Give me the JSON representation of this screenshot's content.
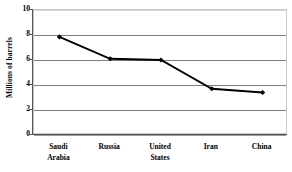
{
  "chart_data": {
    "type": "line",
    "title": "",
    "xlabel": "",
    "ylabel": "Millions of barrels",
    "categories": [
      "Saudi Arabia",
      "Russia",
      "United States",
      "Iran",
      "China"
    ],
    "values": [
      7.85,
      6.1,
      6.0,
      3.7,
      3.4
    ],
    "series": [
      {
        "name": "Oil production",
        "values": [
          7.85,
          6.1,
          6.0,
          3.7,
          3.4
        ]
      }
    ],
    "ylim": [
      0,
      10
    ],
    "yticks": [
      0,
      2,
      4,
      6,
      8,
      10
    ],
    "ytick_labels": [
      "0",
      "2",
      "4",
      "6",
      "8",
      "10"
    ],
    "grid": true,
    "legend": "none",
    "marker": "diamond",
    "line_color": "#000000",
    "marker_color": "#000000",
    "gridline_color": "#7f7f7f",
    "plot_border_color": "#c8c8c8",
    "axis_color": "#555555"
  },
  "axis": {
    "y_title": "Millions of barrels",
    "ticks": [
      {
        "label": "10",
        "value": 10
      },
      {
        "label": "8",
        "value": 8
      },
      {
        "label": "6",
        "value": 6
      },
      {
        "label": "4",
        "value": 4
      },
      {
        "label": "2",
        "value": 2
      },
      {
        "label": "0",
        "value": 0
      }
    ],
    "categories": [
      {
        "line1": "Saudi",
        "line2": "Arabia"
      },
      {
        "line1": "Russia",
        "line2": ""
      },
      {
        "line1": "United",
        "line2": "States"
      },
      {
        "line1": "Iran",
        "line2": ""
      },
      {
        "line1": "China",
        "line2": ""
      }
    ]
  }
}
